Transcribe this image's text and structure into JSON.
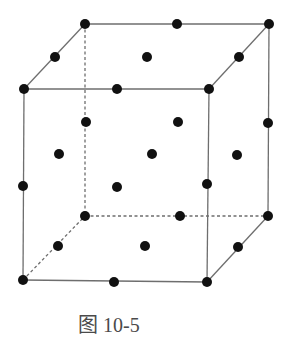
{
  "figure": {
    "caption": "图 10-5",
    "colors": {
      "edge": "#6e6e6e",
      "atom": "#111111",
      "caption": "#4a4a4a"
    },
    "vertices": {
      "ftl": [
        24,
        89
      ],
      "ftr": [
        209,
        89
      ],
      "fbl": [
        23,
        280
      ],
      "fbr": [
        207,
        282
      ],
      "btl": [
        85,
        24
      ],
      "btr": [
        269,
        24
      ],
      "bbl": [
        85,
        216
      ],
      "bbr": [
        268,
        216
      ]
    },
    "edges_solid": [
      [
        "ftl",
        "ftr"
      ],
      [
        "ftr",
        "fbr"
      ],
      [
        "fbr",
        "fbl"
      ],
      [
        "fbl",
        "ftl"
      ],
      [
        "btl",
        "btr"
      ],
      [
        "btr",
        "bbr"
      ],
      [
        "ftl",
        "btl"
      ],
      [
        "ftr",
        "btr"
      ],
      [
        "fbr",
        "bbr"
      ]
    ],
    "edges_dashed": [
      [
        "btl",
        "bbl"
      ],
      [
        "bbl",
        "bbr"
      ],
      [
        "fbl",
        "bbl"
      ]
    ],
    "atoms": [
      [
        85,
        24
      ],
      [
        177,
        24
      ],
      [
        269,
        24
      ],
      [
        55,
        57
      ],
      [
        147,
        57
      ],
      [
        239,
        57
      ],
      [
        24,
        89
      ],
      [
        117,
        89
      ],
      [
        209,
        89
      ],
      [
        86,
        122
      ],
      [
        178,
        122
      ],
      [
        268,
        123
      ],
      [
        59,
        154
      ],
      [
        152,
        154
      ],
      [
        237,
        155
      ],
      [
        23,
        186
      ],
      [
        117,
        187
      ],
      [
        207,
        184
      ],
      [
        85,
        216
      ],
      [
        180,
        216
      ],
      [
        268,
        216
      ],
      [
        58,
        246
      ],
      [
        145,
        246
      ],
      [
        238,
        247
      ],
      [
        23,
        280
      ],
      [
        114,
        282
      ],
      [
        207,
        282
      ]
    ],
    "atom_radius": 5
  }
}
